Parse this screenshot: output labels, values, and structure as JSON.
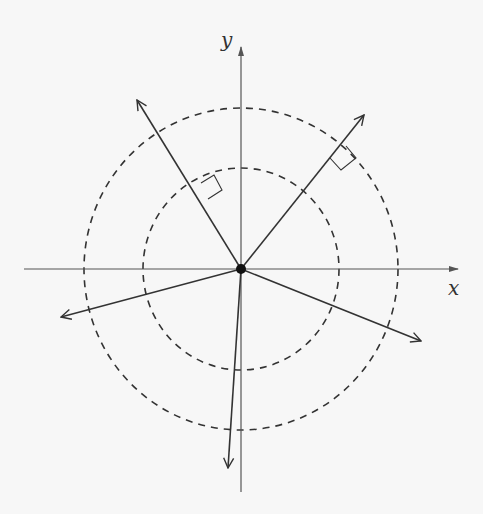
{
  "diagram": {
    "type": "vector-diagram",
    "origin": {
      "x": 241,
      "y": 269
    },
    "axes": {
      "x": {
        "label": "x",
        "from": [
          24,
          269
        ],
        "to": [
          458,
          269
        ],
        "label_pos": [
          448,
          276
        ]
      },
      "y": {
        "label": "y",
        "from": [
          241,
          492
        ],
        "to": [
          241,
          47
        ],
        "label_pos": [
          221,
          28
        ]
      }
    },
    "circles": [
      {
        "name": "inner-circle",
        "rx": 98,
        "ry": 101,
        "style": "dashed"
      },
      {
        "name": "outer-circle",
        "rx": 157,
        "ry": 161,
        "style": "dashed"
      }
    ],
    "vectors": [
      {
        "name": "vector-nw",
        "tip": [
          137,
          100
        ]
      },
      {
        "name": "vector-ne",
        "tip": [
          364,
          115
        ]
      },
      {
        "name": "vector-w",
        "tip": [
          61,
          317
        ]
      },
      {
        "name": "vector-se",
        "tip": [
          421,
          341
        ]
      },
      {
        "name": "vector-s",
        "tip": [
          228,
          468
        ]
      }
    ],
    "right_angle_markers": [
      {
        "name": "right-angle-nw",
        "points": [
          [
            201,
            183
          ],
          [
            214,
            175
          ],
          [
            222,
            190
          ],
          [
            208,
            199
          ]
        ]
      },
      {
        "name": "right-angle-ne",
        "points": [
          [
            330,
            158
          ],
          [
            341,
            170
          ],
          [
            356,
            158
          ],
          [
            346,
            146
          ]
        ]
      }
    ],
    "colors": {
      "line": "#333333",
      "axis": "#555555",
      "background": "#f7f7f7"
    }
  }
}
